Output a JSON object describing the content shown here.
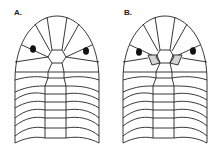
{
  "panels": [
    {
      "label": "A.",
      "highlighted_scales": false
    },
    {
      "label": "B.",
      "highlighted_scales": true
    }
  ],
  "colors": {
    "stroke": "#222222",
    "highlight": "#d4d4d4",
    "eye": "#111111",
    "background": "#ffffff"
  }
}
